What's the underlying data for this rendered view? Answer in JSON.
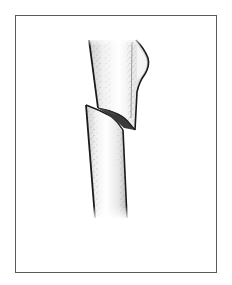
{
  "figure": {
    "alt": "Illustration of a plant stem with an angled cut, upper section offset above lower section",
    "colors": {
      "background": "#ffffff",
      "frame": "#5a5a5a",
      "outline": "#1a1a1a",
      "cut_face": "#3a3a3a",
      "stipple": "#6a6a6a",
      "shade": "#d8d8d8"
    }
  }
}
